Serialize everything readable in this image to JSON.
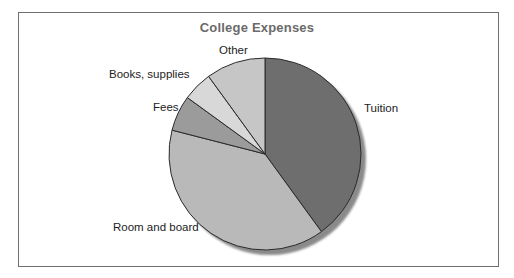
{
  "chart_data": {
    "type": "pie",
    "title": "College Expenses",
    "categories": [
      "Tuition",
      "Room and board",
      "Fees",
      "Books, supplies",
      "Other"
    ],
    "values": [
      40,
      39,
      6,
      5,
      10
    ],
    "unit": "percent (estimated from slice angles)",
    "colors": [
      "#6e6e6e",
      "#b9b9b9",
      "#9b9b9b",
      "#d8d8d8",
      "#c6c6c6"
    ],
    "start_angle_deg": 0,
    "direction": "clockwise",
    "legend": "none (direct slice labels)",
    "shadow": true
  },
  "labels": {
    "tuition": "Tuition",
    "room": "Room and board",
    "fees": "Fees",
    "books": "Books, supplies",
    "other": "Other"
  }
}
